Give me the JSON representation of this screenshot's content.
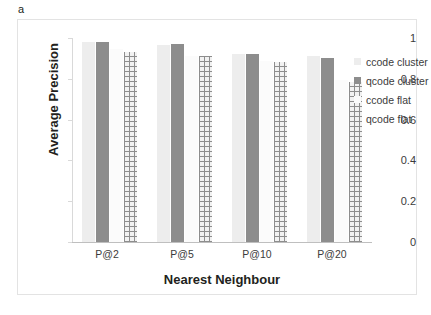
{
  "panel": {
    "label": "a"
  },
  "chart_data": {
    "type": "bar",
    "title": "",
    "xlabel": "Nearest Neighbour",
    "ylabel": "Average Precision",
    "categories": [
      "P@2",
      "P@5",
      "P@10",
      "P@20"
    ],
    "series": [
      {
        "name": "ccode cluster",
        "color": "#ededed",
        "pattern": "solid-light",
        "values": [
          0.98,
          0.965,
          0.92,
          0.91
        ]
      },
      {
        "name": "qcode cluster",
        "color": "#8d8d8d",
        "pattern": "solid",
        "values": [
          0.98,
          0.97,
          0.92,
          0.9
        ]
      },
      {
        "name": "ccode flat",
        "color": "#fbfbfb",
        "pattern": "solid-white",
        "values": [
          0.945,
          0.91,
          0.885,
          0.795
        ]
      },
      {
        "name": "qcode flat",
        "color": "#8d8d8d",
        "pattern": "grid",
        "values": [
          0.93,
          0.91,
          0.88,
          0.785
        ]
      }
    ],
    "ylim": [
      0,
      1
    ],
    "yticks": [
      0,
      0.2,
      0.4,
      0.6,
      0.8,
      1
    ],
    "ytick_labels": [
      "0",
      "0.2",
      "0.4",
      "0.6",
      "0.8",
      "1"
    ],
    "grid": false,
    "legend_position": "right"
  },
  "legend": {
    "items": [
      {
        "label": "ccode cluster"
      },
      {
        "label": "qcode cluster"
      },
      {
        "label": "ccode flat"
      },
      {
        "label": "qcode flat"
      }
    ]
  }
}
